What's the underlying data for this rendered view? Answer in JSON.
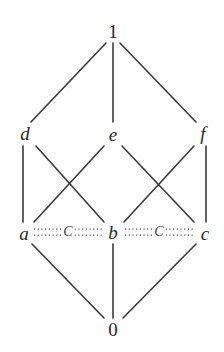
{
  "figure": {
    "type": "hasse-diagram",
    "title": "",
    "background_color": "#fefefe",
    "line_color": "#3a3a3a",
    "label_color": "#2a2a2a",
    "width": 224,
    "height": 352
  },
  "nodes": [
    {
      "id": "top",
      "label": "1",
      "style": "numeral",
      "x": 113,
      "y": 31
    },
    {
      "id": "d",
      "label": "d",
      "style": "italic",
      "x": 25,
      "y": 133
    },
    {
      "id": "e",
      "label": "e",
      "style": "italic",
      "x": 113,
      "y": 134
    },
    {
      "id": "f",
      "label": "f",
      "style": "italic",
      "x": 203,
      "y": 133
    },
    {
      "id": "a",
      "label": "a",
      "style": "italic",
      "x": 24,
      "y": 233
    },
    {
      "id": "b",
      "label": "b",
      "style": "italic",
      "x": 113,
      "y": 232
    },
    {
      "id": "c",
      "label": "c",
      "style": "italic",
      "x": 205,
      "y": 233
    },
    {
      "id": "bottom",
      "label": "0",
      "style": "numeral",
      "x": 113,
      "y": 329
    }
  ],
  "edges": [
    {
      "from": "top",
      "to": "d",
      "kind": "solid"
    },
    {
      "from": "top",
      "to": "e",
      "kind": "solid"
    },
    {
      "from": "top",
      "to": "f",
      "kind": "solid"
    },
    {
      "from": "d",
      "to": "a",
      "kind": "solid"
    },
    {
      "from": "d",
      "to": "b",
      "kind": "solid"
    },
    {
      "from": "e",
      "to": "a",
      "kind": "solid"
    },
    {
      "from": "e",
      "to": "c",
      "kind": "solid"
    },
    {
      "from": "f",
      "to": "b",
      "kind": "solid"
    },
    {
      "from": "f",
      "to": "c",
      "kind": "solid"
    },
    {
      "from": "a",
      "to": "bottom",
      "kind": "solid"
    },
    {
      "from": "b",
      "to": "bottom",
      "kind": "solid"
    },
    {
      "from": "c",
      "to": "bottom",
      "kind": "solid"
    }
  ],
  "congruence_edges": [
    {
      "from": "a",
      "to": "b",
      "label": "C",
      "kind": "dotted",
      "label_x": 68,
      "label_y": 232
    },
    {
      "from": "b",
      "to": "c",
      "label": "C",
      "kind": "dotted",
      "label_x": 159,
      "label_y": 232
    }
  ],
  "labels": {
    "top": "1",
    "d": "d",
    "e": "e",
    "f": "f",
    "a": "a",
    "b": "b",
    "c": "c",
    "bottom": "0",
    "congruence_left": "C",
    "congruence_right": "C"
  }
}
